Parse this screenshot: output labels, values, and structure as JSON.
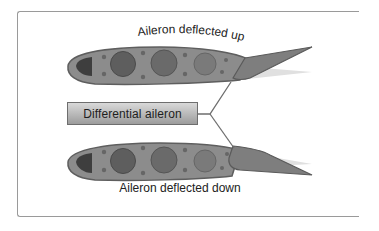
{
  "diagram": {
    "top_label": "Aileron deflected up",
    "center_label": "Differential aileron",
    "bottom_label": "Aileron deflected down",
    "colors": {
      "airfoil_fill": "#8a8a8a",
      "airfoil_outline": "#5a5a5a",
      "circle_fill": "#6a6a6a",
      "leading_cavity": "#3c3c3c",
      "ghost_aileron": "#dedede",
      "connector": "#6e6e6e",
      "frame_border": "#9a9a9a"
    },
    "airfoils": [
      {
        "name": "upper-airfoil",
        "aileron_state": "deflected up"
      },
      {
        "name": "lower-airfoil",
        "aileron_state": "deflected down"
      }
    ]
  }
}
